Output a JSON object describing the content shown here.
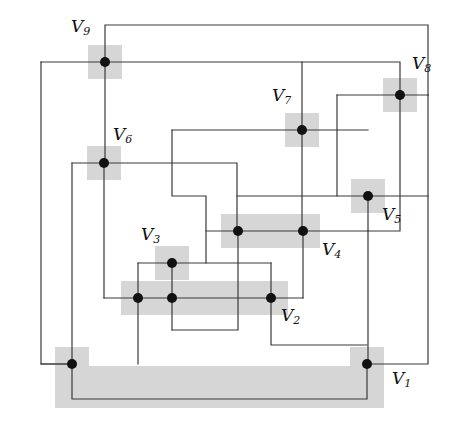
{
  "figure": {
    "width": 457,
    "height": 430,
    "background_color": "#ffffff",
    "edge_color": "#3a3a3a",
    "node_color": "#111111",
    "highlight_color": "#d6d6d6",
    "edge_width": 1.2,
    "node_radius": 5
  },
  "labels": [
    {
      "id": "V9",
      "base": "V",
      "sub": "9",
      "x": 71,
      "y": 18,
      "text": "V9"
    },
    {
      "id": "V8",
      "base": "V",
      "sub": "8",
      "x": 412,
      "y": 55,
      "text": "V8"
    },
    {
      "id": "V7",
      "base": "V",
      "sub": "7",
      "x": 272,
      "y": 87,
      "text": "V7"
    },
    {
      "id": "V6",
      "base": "V",
      "sub": "6",
      "x": 113,
      "y": 126,
      "text": "V6"
    },
    {
      "id": "V5",
      "base": "V",
      "sub": "5",
      "x": 382,
      "y": 206,
      "text": "V5"
    },
    {
      "id": "V3",
      "base": "V",
      "sub": "3",
      "x": 141,
      "y": 226,
      "text": "V3"
    },
    {
      "id": "V4",
      "base": "V",
      "sub": "4",
      "x": 322,
      "y": 241,
      "text": "V4"
    },
    {
      "id": "V2",
      "base": "V",
      "sub": "2",
      "x": 281,
      "y": 307,
      "text": "V2"
    },
    {
      "id": "V1",
      "base": "V",
      "sub": "1",
      "x": 392,
      "y": 370,
      "text": "V1"
    }
  ],
  "nodes": [
    {
      "id": "V9",
      "x": 105,
      "y": 62,
      "label": "V9"
    },
    {
      "id": "V8",
      "x": 400,
      "y": 95,
      "label": "V8"
    },
    {
      "id": "V7",
      "x": 302,
      "y": 130,
      "label": "V7"
    },
    {
      "id": "V6",
      "x": 104,
      "y": 163,
      "label": "V6"
    },
    {
      "id": "V5",
      "x": 368,
      "y": 196,
      "label": "V5"
    },
    {
      "id": "V4a",
      "x": 238,
      "y": 231,
      "label": ""
    },
    {
      "id": "V4",
      "x": 303,
      "y": 231,
      "label": "V4"
    },
    {
      "id": "V3",
      "x": 172,
      "y": 263,
      "label": "V3"
    },
    {
      "id": "V2a",
      "x": 138,
      "y": 298,
      "label": ""
    },
    {
      "id": "V2b",
      "x": 172,
      "y": 298,
      "label": ""
    },
    {
      "id": "V2",
      "x": 271,
      "y": 298,
      "label": "V2"
    },
    {
      "id": "V1a",
      "x": 72,
      "y": 364,
      "label": ""
    },
    {
      "id": "V1",
      "x": 367,
      "y": 364,
      "label": "V1"
    }
  ],
  "highlight_rects": [
    {
      "x": 88,
      "y": 45,
      "w": 34,
      "h": 34
    },
    {
      "x": 383,
      "y": 78,
      "w": 34,
      "h": 34
    },
    {
      "x": 285,
      "y": 113,
      "w": 34,
      "h": 34
    },
    {
      "x": 87,
      "y": 146,
      "w": 34,
      "h": 34
    },
    {
      "x": 351,
      "y": 179,
      "w": 34,
      "h": 34
    },
    {
      "x": 221,
      "y": 214,
      "w": 99,
      "h": 34
    },
    {
      "x": 155,
      "y": 246,
      "w": 34,
      "h": 34
    },
    {
      "x": 121,
      "y": 281,
      "w": 167,
      "h": 34
    },
    {
      "x": 55,
      "y": 347,
      "w": 34,
      "h": 34
    },
    {
      "x": 350,
      "y": 347,
      "w": 34,
      "h": 34
    },
    {
      "x": 55,
      "y": 366,
      "w": 329,
      "h": 42
    }
  ],
  "polylines": [
    {
      "name": "edge-v9-top-to-v8",
      "points": "105,62 105,25 428,25 428,95"
    },
    {
      "name": "edge-v9-horizontal",
      "points": "41,62 105,62 400,62 400,95"
    },
    {
      "name": "edge-left-outer",
      "points": "41,62 41,364 72,364"
    },
    {
      "name": "edge-v9-v6",
      "points": "105,62 105,163"
    },
    {
      "name": "edge-v6-horizontal",
      "points": "72,163 104,163 237,163 237,231"
    },
    {
      "name": "edge-v6-down",
      "points": "104,163 104,298"
    },
    {
      "name": "edge-v6-left-down",
      "points": "72,163 72,364"
    },
    {
      "name": "edge-v7-up",
      "points": "302,130 302,62"
    },
    {
      "name": "edge-v7-horizontal",
      "points": "172,130 302,130 368,130"
    },
    {
      "name": "edge-v7-box-left",
      "points": "172,130 172,196 206,196 206,263"
    },
    {
      "name": "edge-v7-down",
      "points": "302,130 302,231"
    },
    {
      "name": "edge-v8-horizontal",
      "points": "337,95 400,95 428,95"
    },
    {
      "name": "edge-v8-box",
      "points": "337,95 337,196"
    },
    {
      "name": "edge-v8-down",
      "points": "400,95 400,231 368,231"
    },
    {
      "name": "edge-v5-horizontal",
      "points": "237,196 337,196 368,196"
    },
    {
      "name": "edge-v5-down",
      "points": "368,196 368,364"
    },
    {
      "name": "edge-v5-right",
      "points": "368,196 428,196"
    },
    {
      "name": "edge-right-outer",
      "points": "428,95 428,364 367,364"
    },
    {
      "name": "edge-v4-horizontal",
      "points": "206,231 238,231 303,231 368,231"
    },
    {
      "name": "edge-v4a-down",
      "points": "238,231 238,330 172,330"
    },
    {
      "name": "edge-v4-down",
      "points": "303,231 303,298"
    },
    {
      "name": "edge-v3-horizontal",
      "points": "138,263 172,263 271,263"
    },
    {
      "name": "edge-v3-down",
      "points": "172,263 172,330"
    },
    {
      "name": "edge-v3-box-left",
      "points": "138,263 138,364"
    },
    {
      "name": "edge-v2-horizontal",
      "points": "104,298 138,298 172,298 271,298 303,298"
    },
    {
      "name": "edge-v2-right-up",
      "points": "271,263 271,298"
    },
    {
      "name": "edge-v2-down",
      "points": "271,298 271,345 367,345"
    },
    {
      "name": "edge-v1-bottom",
      "points": "72,364 72,399 367,399 367,364"
    },
    {
      "name": "edge-v1a-left",
      "points": "41,364 72,364"
    }
  ]
}
